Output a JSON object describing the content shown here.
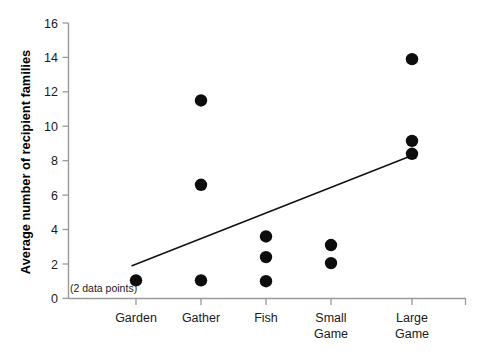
{
  "chart_data": {
    "type": "scatter",
    "title": "",
    "xlabel": "",
    "ylabel": "Average number of recipient families",
    "categories": [
      "Garden",
      "Gather",
      "Fish",
      "Small Game",
      "Large Game"
    ],
    "category_labels_wrapped": [
      [
        "Garden"
      ],
      [
        "Gather"
      ],
      [
        "Fish"
      ],
      [
        "Small",
        "Game"
      ],
      [
        "Large",
        "Game"
      ]
    ],
    "ylim": [
      0,
      16
    ],
    "yticks": [
      0,
      2,
      4,
      6,
      8,
      10,
      12,
      14,
      16
    ],
    "ytick_labels": [
      "0",
      "2",
      "4",
      "6",
      "8",
      "10",
      "12",
      "14",
      "16"
    ],
    "grid": false,
    "legend": false,
    "series": [
      {
        "name": "Average number of recipient families",
        "marker": "filled-circle",
        "marker_color": "#0d0d0d",
        "points": [
          {
            "category": "Garden",
            "x_index": 0,
            "value": 1.05
          },
          {
            "category": "Gather",
            "x_index": 1,
            "value": 11.5
          },
          {
            "category": "Gather",
            "x_index": 1,
            "value": 6.6
          },
          {
            "category": "Gather",
            "x_index": 1,
            "value": 1.05
          },
          {
            "category": "Fish",
            "x_index": 2,
            "value": 3.6
          },
          {
            "category": "Fish",
            "x_index": 2,
            "value": 2.4
          },
          {
            "category": "Fish",
            "x_index": 2,
            "value": 1.0
          },
          {
            "category": "Small Game",
            "x_index": 3,
            "value": 3.1
          },
          {
            "category": "Small Game",
            "x_index": 3,
            "value": 2.05
          },
          {
            "category": "Large Game",
            "x_index": 4,
            "value": 13.9
          },
          {
            "category": "Large Game",
            "x_index": 4,
            "value": 9.15
          },
          {
            "category": "Large Game",
            "x_index": 4,
            "value": 8.4
          }
        ]
      }
    ],
    "trendline": {
      "type": "line",
      "color": "#111111",
      "start": {
        "x_index": 0,
        "value": 1.9
      },
      "end": {
        "x_index": 4,
        "value": 8.3
      }
    },
    "annotations": [
      {
        "text": "(2 data points)",
        "x_index": 0,
        "value": 1.05,
        "placement": "left-of-point"
      }
    ]
  }
}
